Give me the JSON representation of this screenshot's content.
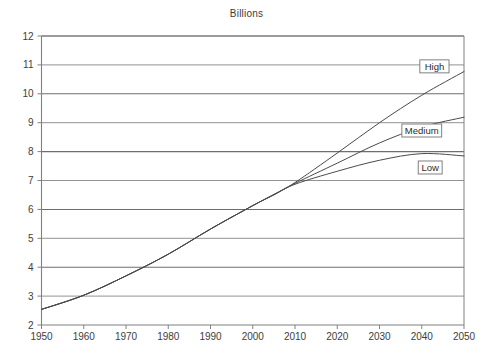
{
  "chart_data": {
    "type": "line",
    "title": "Billions",
    "subtitle": "",
    "xlabel": "",
    "ylabel": "",
    "xlim": [
      1950,
      2050
    ],
    "ylim": [
      2,
      12
    ],
    "grid": true,
    "grid_axis": "y",
    "legend_position": "inline-right-labels",
    "x_ticks": [
      1950,
      1960,
      1970,
      1980,
      1990,
      2000,
      2010,
      2020,
      2030,
      2040,
      2050
    ],
    "y_ticks": [
      2,
      3,
      4,
      5,
      6,
      7,
      8,
      9,
      10,
      11,
      12
    ],
    "x": [
      1950,
      1960,
      1970,
      1980,
      1990,
      2000,
      2005,
      2010,
      2020,
      2030,
      2040,
      2050
    ],
    "series": [
      {
        "name": "High",
        "color": "#4a4a4a",
        "values": [
          2.54,
          3.03,
          3.7,
          4.45,
          5.32,
          6.13,
          6.52,
          6.93,
          7.95,
          9.0,
          9.95,
          10.77
        ]
      },
      {
        "name": "Medium",
        "color": "#4a4a4a",
        "values": [
          2.54,
          3.03,
          3.7,
          4.45,
          5.32,
          6.13,
          6.51,
          6.9,
          7.6,
          8.3,
          8.85,
          9.19
        ]
      },
      {
        "name": "Low",
        "color": "#4a4a4a",
        "values": [
          2.54,
          3.03,
          3.7,
          4.45,
          5.32,
          6.13,
          6.5,
          6.87,
          7.32,
          7.7,
          7.93,
          7.85
        ]
      }
    ],
    "annotations": [
      {
        "label": "High",
        "x": 2043,
        "y": 10.95
      },
      {
        "label": "Medium",
        "x": 2040,
        "y": 8.73
      },
      {
        "label": "Low",
        "x": 2042,
        "y": 7.45
      }
    ],
    "axis_color": "#808080",
    "gridline_color": "#6e6e6e",
    "plot_background": "#ffffff"
  },
  "figure": {
    "title": "Billions"
  }
}
